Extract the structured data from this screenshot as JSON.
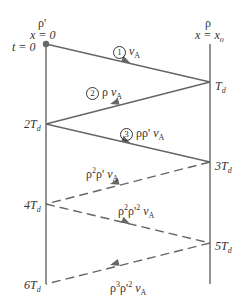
{
  "diagram": {
    "type": "bounce-diagram",
    "colors": {
      "line": "#666666",
      "text": "#333333",
      "background": "#ffffff"
    },
    "left_boundary": {
      "rho": "ρ'",
      "x": "x = 0",
      "t0": "t = 0"
    },
    "right_boundary": {
      "rho": "ρ",
      "x": "x = x",
      "x_sub": "o"
    },
    "time_marks": {
      "t1": "T",
      "t1_sub": "d",
      "t2": "2T",
      "t2_sub": "d",
      "t3": "3T",
      "t3_sub": "d",
      "t4": "4T",
      "t4_sub": "d",
      "t5": "5T",
      "t5_sub": "d",
      "t6": "6T",
      "t6_sub": "d"
    },
    "waves": [
      {
        "num": "1",
        "coef": "",
        "v": "v",
        "v_sub": "A",
        "style": "solid",
        "direction": "right"
      },
      {
        "num": "2",
        "coef": "ρ ",
        "v": "v",
        "v_sub": "A",
        "style": "solid",
        "direction": "left"
      },
      {
        "num": "3",
        "coef": "ρρ' ",
        "v": "v",
        "v_sub": "A",
        "style": "solid",
        "direction": "right"
      },
      {
        "num": "",
        "coef_a": "ρ",
        "sup_a": "2",
        "coef_b": "ρ' ",
        "v": "v",
        "v_sub": "A",
        "style": "dashed",
        "direction": "left"
      },
      {
        "num": "",
        "coef_a": "ρ",
        "sup_a": "2",
        "coef_b": "ρ'",
        "sup_b": "2",
        "v": " v",
        "v_sub": "A",
        "style": "dashed",
        "direction": "right"
      },
      {
        "num": "",
        "coef_a": "ρ",
        "sup_a": "3",
        "coef_b": "ρ'",
        "sup_b": "2",
        "v": " v",
        "v_sub": "A",
        "style": "dashed",
        "direction": "left"
      }
    ]
  }
}
